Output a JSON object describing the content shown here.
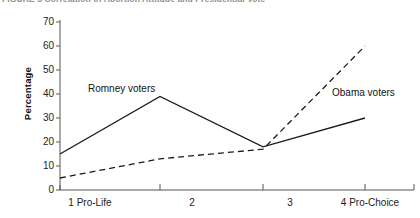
{
  "caption": {
    "text": "FIGURE 5  Correlation of Abortion Attitude and Presidential Vote"
  },
  "chart_data": {
    "type": "line",
    "title": "",
    "xlabel": "",
    "ylabel": "Percentage",
    "categories": [
      "1 Pro-Life",
      "2",
      "3",
      "4 Pro-Choice"
    ],
    "x": [
      1,
      2,
      3,
      4
    ],
    "ylim": [
      0,
      70
    ],
    "yticks": [
      0,
      10,
      20,
      30,
      40,
      50,
      60,
      70
    ],
    "grid": false,
    "legend": "inline-annotations",
    "series": [
      {
        "name": "Romney voters",
        "style": "solid",
        "color": "#1a1a1a",
        "values": [
          15,
          39,
          18,
          30
        ],
        "label_x": 2,
        "label_y": 42
      },
      {
        "name": "Obama voters",
        "style": "dashed",
        "color": "#1a1a1a",
        "values": [
          5,
          13,
          17,
          60
        ],
        "label_x": 4,
        "label_y": 38
      }
    ]
  },
  "axis": {
    "y_tick_labels": [
      "70",
      "60",
      "50",
      "40",
      "30",
      "20",
      "10",
      "0"
    ],
    "x_tick_labels": [
      "1 Pro-Life",
      "2",
      "3",
      "4 Pro-Choice"
    ]
  }
}
